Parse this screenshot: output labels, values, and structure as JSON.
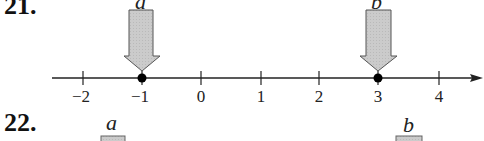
{
  "problems": [
    {
      "number": "21.",
      "number_line": {
        "min_label": -2,
        "max_label": 4,
        "ticks": [
          "−2",
          "−1",
          "0",
          "1",
          "2",
          "3",
          "4"
        ],
        "points": [
          {
            "name": "a",
            "value": -1
          },
          {
            "name": "b",
            "value": 3
          }
        ]
      },
      "arrows": [
        {
          "label": "a",
          "points_to": -1
        },
        {
          "label": "b",
          "points_to": 3
        }
      ]
    },
    {
      "number": "22.",
      "labels": [
        "a",
        "b"
      ]
    }
  ],
  "colors": {
    "arrow_fill": "#c8c8c8",
    "arrow_stroke": "#555555",
    "line": "#222222",
    "dot": "#000000"
  }
}
